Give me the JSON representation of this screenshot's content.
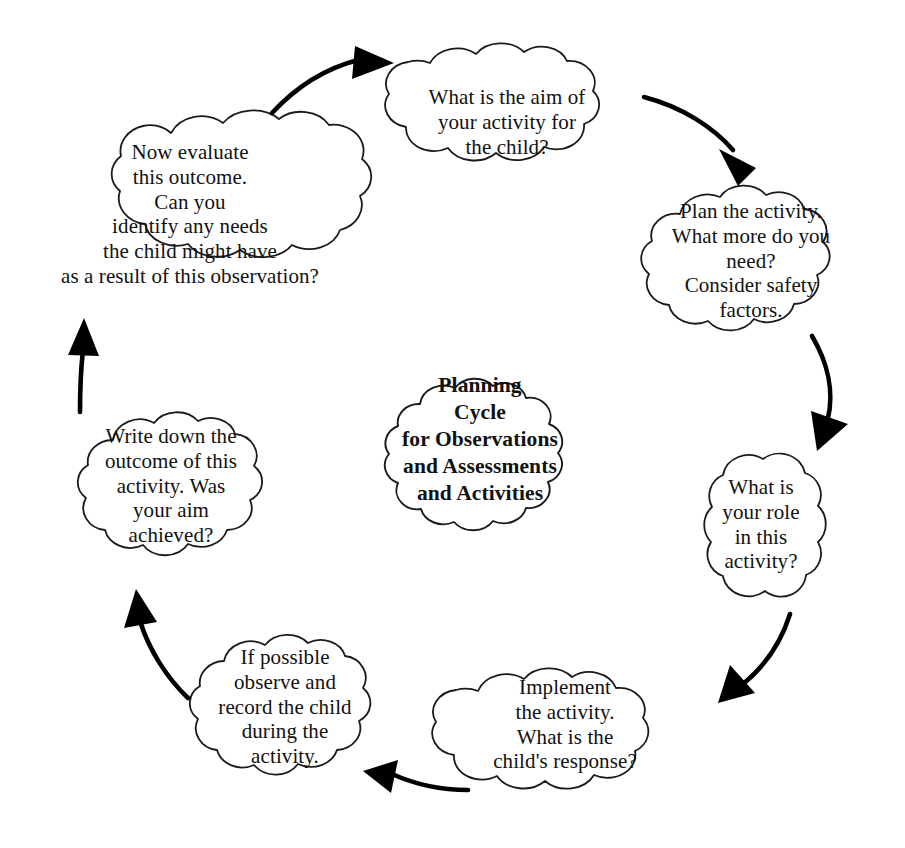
{
  "diagram": {
    "title": "Planning Cycle for Observations and Assessments and Activities",
    "type": "circular-cycle-diagram",
    "shape": "cloud",
    "outline_color": "#1a1a1a",
    "fill_color": "#ffffff",
    "text_color": "#111111",
    "arrow_color": "#000000",
    "direction": "clockwise",
    "center": {
      "name": "planning-cycle-center",
      "text": "Planning\nCycle\nfor Observations\nand Assessments\nand Activities",
      "bold": true
    },
    "steps": [
      {
        "id": 1,
        "name": "aim-of-activity",
        "text": "What is the aim of\nyour activity for\nthe child?",
        "position": "top"
      },
      {
        "id": 2,
        "name": "plan-the-activity",
        "text": "Plan the activity.\nWhat more do you\nneed?\nConsider safety\nfactors.",
        "position": "top-right"
      },
      {
        "id": 3,
        "name": "your-role",
        "text": "What is\nyour role\nin this\nactivity?",
        "position": "right"
      },
      {
        "id": 4,
        "name": "implement-the-activity",
        "text": "Implement\nthe activity.\nWhat is the\nchild's response?",
        "position": "bottom-right"
      },
      {
        "id": 5,
        "name": "observe-and-record",
        "text": "If possible\nobserve and\nrecord the child\nduring the\nactivity.",
        "position": "bottom-left"
      },
      {
        "id": 6,
        "name": "write-down-outcome",
        "text": "Write down the\noutcome of this\nactivity. Was\nyour aim\nachieved?",
        "position": "left"
      },
      {
        "id": 7,
        "name": "evaluate-outcome",
        "text": "Now evaluate\nthis outcome.\nCan you\nidentify any needs\nthe child might have\nas a result of this observation?",
        "position": "top-left"
      }
    ],
    "arrows": [
      {
        "name": "arrow-evaluate-to-aim",
        "from": "evaluate-outcome",
        "to": "aim-of-activity"
      },
      {
        "name": "arrow-aim-to-plan",
        "from": "aim-of-activity",
        "to": "plan-the-activity"
      },
      {
        "name": "arrow-plan-to-role",
        "from": "plan-the-activity",
        "to": "your-role"
      },
      {
        "name": "arrow-role-to-implement",
        "from": "your-role",
        "to": "implement-the-activity"
      },
      {
        "name": "arrow-implement-to-observe",
        "from": "implement-the-activity",
        "to": "observe-and-record"
      },
      {
        "name": "arrow-observe-to-write",
        "from": "observe-and-record",
        "to": "write-down-outcome"
      },
      {
        "name": "arrow-write-to-evaluate",
        "from": "write-down-outcome",
        "to": "evaluate-outcome"
      }
    ]
  }
}
